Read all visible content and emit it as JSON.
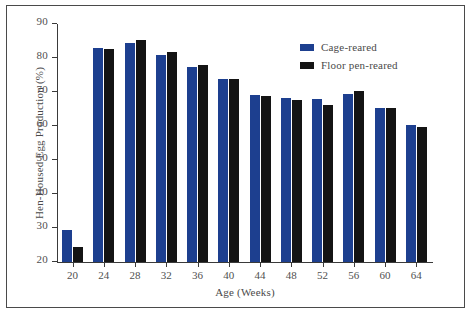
{
  "chart_data": {
    "type": "bar",
    "title": "",
    "xlabel": "Age (Weeks)",
    "ylabel": "Hen-Housed Egg Production (%)",
    "categories": [
      20,
      24,
      28,
      32,
      36,
      40,
      44,
      48,
      52,
      56,
      60,
      64
    ],
    "category_labels": [
      "20",
      "24",
      "28",
      "32",
      "36",
      "40",
      "44",
      "48",
      "52",
      "56",
      "60",
      "64"
    ],
    "series": [
      {
        "name": "Cage-reared",
        "color": "#1d3f8f",
        "values": [
          29.5,
          83.0,
          84.3,
          81.0,
          77.3,
          73.8,
          69.2,
          68.2,
          67.8,
          69.3,
          65.3,
          60.3
        ]
      },
      {
        "name": "Floor pen-reared",
        "color": "#141414",
        "values": [
          24.5,
          82.7,
          85.3,
          81.8,
          78.0,
          73.7,
          68.8,
          67.7,
          66.3,
          70.2,
          65.4,
          59.8
        ]
      }
    ],
    "ylim": [
      20,
      90
    ],
    "yticks": [
      20,
      30,
      40,
      50,
      60,
      70,
      80,
      90
    ],
    "ytick_labels": [
      "20",
      "30",
      "40",
      "50",
      "60",
      "70",
      "80",
      "90"
    ],
    "grid": false,
    "legend_position": "top-right"
  },
  "legend": {
    "entries": [
      {
        "label": "Cage-reared",
        "color": "#1d3f8f"
      },
      {
        "label": "Floor pen-reared",
        "color": "#141414"
      }
    ]
  },
  "colors": {
    "cage": "#1d3f8f",
    "floor": "#141414",
    "axis": "#3a3a3a",
    "text": "#4a4a4a",
    "frame": "#4a4a4a",
    "background": "#ffffff"
  }
}
